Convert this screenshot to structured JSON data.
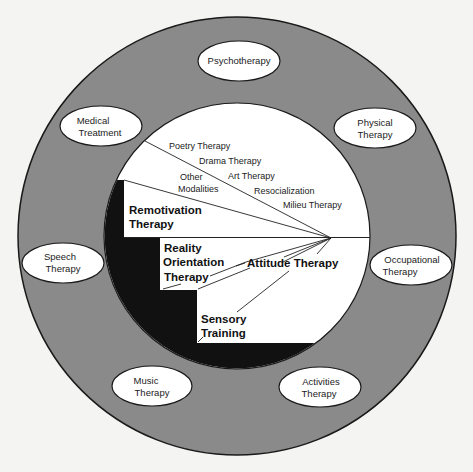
{
  "diagram": {
    "outer_ring": {
      "color": "#8a8a8a",
      "therapies": [
        {
          "id": "psychotherapy",
          "lines": [
            "Psychotherapy"
          ],
          "cx": 239,
          "cy": 61
        },
        {
          "id": "physical",
          "lines": [
            "Physical",
            "Therapy"
          ],
          "cx": 375,
          "cy": 128
        },
        {
          "id": "occupational",
          "lines": [
            "Occupational",
            "Therapy"
          ],
          "cx": 411,
          "cy": 265
        },
        {
          "id": "activities",
          "lines": [
            "Activities",
            "Therapy"
          ],
          "cx": 320,
          "cy": 387
        },
        {
          "id": "music",
          "lines": [
            "Music",
            "Therapy"
          ],
          "cx": 152,
          "cy": 386
        },
        {
          "id": "speech",
          "lines": [
            "Speech",
            "Therapy"
          ],
          "cx": 63,
          "cy": 263
        },
        {
          "id": "medical",
          "lines": [
            "Medical",
            "Treatment"
          ],
          "cx": 101,
          "cy": 126
        }
      ]
    },
    "upper_section": {
      "other_modalities_label": [
        "Other",
        "Modalities"
      ],
      "modalities": [
        "Poetry Therapy",
        "Drama Therapy",
        "Art Therapy",
        "Resocialization",
        "Milieu Therapy"
      ],
      "remotivation_label": [
        "Remotivation",
        "Therapy"
      ]
    },
    "lower_section": {
      "reality_orientation_label": [
        "Reality",
        "Orientation",
        "Therapy"
      ],
      "attitude_label": "Attitude Therapy",
      "sensory_label": [
        "Sensory",
        "Training"
      ]
    }
  }
}
